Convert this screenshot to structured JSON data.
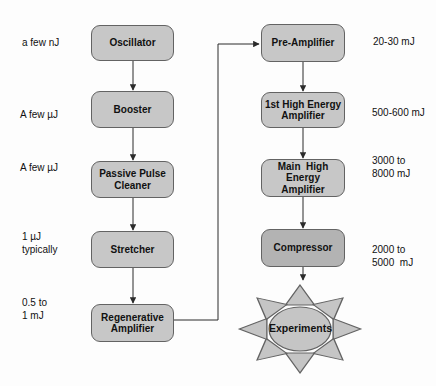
{
  "colors": {
    "background": "#fdfdfd",
    "box_fill": "#c7c7c7",
    "box_fill_dark": "#b3b3b3",
    "box_border": "#636363",
    "sun_fill": "#c5c5c5",
    "line": "#2b2b2b",
    "text": "#111111"
  },
  "left_chain": {
    "stages": [
      {
        "label": "Oscillator",
        "energy": "a few nJ"
      },
      {
        "label": "Booster",
        "energy": "A few µJ"
      },
      {
        "label": "Passive Pulse\nCleaner",
        "energy": "A few µJ"
      },
      {
        "label": "Stretcher",
        "energy": "1 µJ\ntypically"
      },
      {
        "label": "Regenerative\nAmplifier",
        "energy": "0.5 to\n1 mJ"
      }
    ]
  },
  "right_chain": {
    "stages": [
      {
        "label": "Pre-Amplifier",
        "energy": "20-30 mJ"
      },
      {
        "label": "1st High Energy\nAmplifier",
        "energy": "500-600 mJ"
      },
      {
        "label": "Main  High\nEnergy\nAmplifier",
        "energy": "3000 to\n8000 mJ"
      },
      {
        "label": "Compressor",
        "energy": "2000 to\n5000  mJ"
      }
    ]
  },
  "experiments": {
    "label": "Experiments"
  }
}
